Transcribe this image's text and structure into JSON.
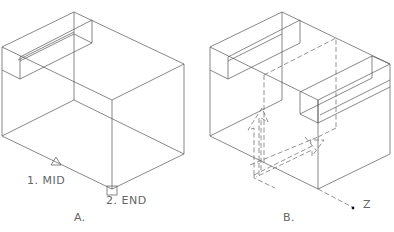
{
  "figure": {
    "panels": [
      {
        "id": "A",
        "caption": "A.",
        "description": "Isometric wireframe box with a slot along the top-left edge; object snap markers on the bottom edge",
        "markers": [
          {
            "step": "1.",
            "snap": "MID",
            "label": "1.  MID",
            "symbol": "triangle"
          },
          {
            "step": "2.",
            "snap": "END",
            "label": "2.  END",
            "symbol": "square"
          }
        ]
      },
      {
        "id": "B",
        "caption": "B.",
        "description": "Same box with a copied slot moved along a dashed path; dashed arrows show movement direction",
        "axis_label": "Z"
      }
    ]
  }
}
